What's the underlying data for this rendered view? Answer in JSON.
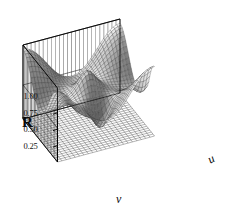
{
  "figure": {
    "type": "surface-plot-3d",
    "background_color": "#ffffff",
    "line_color": "#1a1a1a",
    "render_style": "shaded-wireframe-grayscale"
  },
  "axes": {
    "vertical": {
      "name": "R",
      "label": "R",
      "ticks": [
        "1.00",
        "0.75",
        "0.50",
        "0.25"
      ],
      "tick_values": [
        1.0,
        0.75,
        0.5,
        0.25
      ],
      "range": [
        0.0,
        1.125
      ]
    },
    "depth": {
      "name": "u",
      "label": "u"
    },
    "width": {
      "name": "v",
      "label": "v"
    }
  },
  "chart_data": {
    "type": "surface",
    "title": "",
    "xlabel": "v",
    "ylabel": "u",
    "zlabel": "R",
    "zlim": [
      0.0,
      1.125
    ],
    "ztick_labels": [
      "1.00",
      "0.75",
      "0.50",
      "0.25"
    ],
    "ztick_values": [
      1.0,
      0.75,
      0.5,
      0.25
    ],
    "xlim": [
      0,
      1
    ],
    "ylim": [
      0,
      1
    ],
    "grid": true,
    "legend": false,
    "colormap": "grayscale",
    "nu": 30,
    "nv": 30,
    "surface_formula": "R = 0.62 + 0.20*cos(2*pi*u)*cos(2*pi*v) + 0.12*cos(2*pi*u) + 0.12*cos(2*pi*v) - 0.30*exp(-((u-0.78)^2+(v-0.52)^2)/0.012) - 0.26*exp(-((u-0.80)^2+(v-0.95)^2)/0.010) + 0.26*exp(-((u-0.46)^2+(v-0.50)^2)/0.013)",
    "features": [
      {
        "name": "central-peak",
        "u": 0.46,
        "v": 0.5,
        "R": 0.98
      },
      {
        "name": "front-deep-well",
        "u": 0.78,
        "v": 0.52,
        "R": 0.18
      },
      {
        "name": "right-deep-well",
        "u": 0.8,
        "v": 0.95,
        "R": 0.22
      },
      {
        "name": "left-ridge",
        "u": 0.1,
        "v": 0.5,
        "R": 0.86
      },
      {
        "name": "back-plateau",
        "u": 0.15,
        "v": 0.15,
        "R": 0.8
      }
    ],
    "view": {
      "azimuth": -52,
      "elevation": 24
    }
  }
}
